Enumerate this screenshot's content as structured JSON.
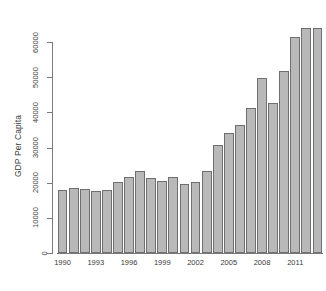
{
  "chart_data": {
    "type": "bar",
    "title": "",
    "xlabel": "",
    "ylabel": "GDP Per Capita",
    "ylim": [
      0,
      65000
    ],
    "grid": false,
    "legend": false,
    "bar_color": "#b9b9b9",
    "bar_border_color": "#6f6f6f",
    "axis_color": "#7a7a7a",
    "y_ticks": [
      0,
      10000,
      20000,
      30000,
      40000,
      50000,
      60000
    ],
    "y_tick_labels": [
      "0",
      "10000",
      "20000",
      "30000",
      "40000",
      "50000",
      "60000"
    ],
    "x_tick_labels": [
      "1990",
      "1993",
      "1996",
      "1999",
      "2002",
      "2005",
      "2008",
      "2011"
    ],
    "x_tick_categories": [
      "1990",
      "1993",
      "1996",
      "1999",
      "2002",
      "2005",
      "2008",
      "2011"
    ],
    "categories": [
      "1990",
      "1991",
      "1992",
      "1993",
      "1994",
      "1995",
      "1996",
      "1997",
      "1998",
      "1999",
      "2000",
      "2001",
      "2002",
      "2003",
      "2004",
      "2005",
      "2006",
      "2007",
      "2008",
      "2009",
      "2010",
      "2011",
      "2012",
      "2013"
    ],
    "values": [
      17900,
      18500,
      18300,
      17500,
      17900,
      20200,
      21700,
      23300,
      21300,
      20600,
      21500,
      19500,
      20100,
      23400,
      30600,
      34200,
      36400,
      41200,
      49700,
      42800,
      51900,
      61500,
      64000,
      64000
    ]
  }
}
